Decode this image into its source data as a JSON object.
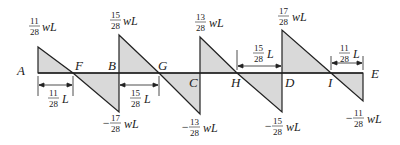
{
  "diagram": {
    "colors": {
      "fill": "#d9d9d9",
      "line": "#222222",
      "background": "#ffffff"
    },
    "points": {
      "A": "A",
      "F": "F",
      "B": "B",
      "G": "G",
      "C": "C",
      "H": "H",
      "D": "D",
      "I": "I",
      "E": "E"
    },
    "values": {
      "A_top": {
        "num": "11",
        "den": "28",
        "unit": "wL",
        "sign": ""
      },
      "B_top": {
        "num": "15",
        "den": "28",
        "unit": "wL",
        "sign": ""
      },
      "B_bot": {
        "num": "17",
        "den": "28",
        "unit": "wL",
        "sign": "−"
      },
      "C_top": {
        "num": "13",
        "den": "28",
        "unit": "wL",
        "sign": ""
      },
      "C_bot": {
        "num": "13",
        "den": "28",
        "unit": "wL",
        "sign": "−"
      },
      "D_top": {
        "num": "17",
        "den": "28",
        "unit": "wL",
        "sign": ""
      },
      "D_bot": {
        "num": "15",
        "den": "28",
        "unit": "wL",
        "sign": "−"
      },
      "E_bot": {
        "num": "11",
        "den": "28",
        "unit": "wL",
        "sign": "−"
      }
    },
    "dimensions": {
      "AF": {
        "num": "11",
        "den": "28",
        "unit": "L"
      },
      "BG": {
        "num": "15",
        "den": "28",
        "unit": "L"
      },
      "HD": {
        "num": "15",
        "den": "28",
        "unit": "L"
      },
      "IE": {
        "num": "11",
        "den": "28",
        "unit": "L"
      }
    }
  }
}
